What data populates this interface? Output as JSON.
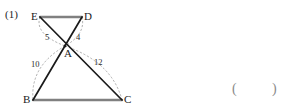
{
  "problem": {
    "number_label": "(1)"
  },
  "figure": {
    "type": "geometry-diagram",
    "vertices": [
      {
        "id": "E",
        "label": "E",
        "x": 40,
        "y": 17
      },
      {
        "id": "D",
        "label": "D",
        "x": 82,
        "y": 17
      },
      {
        "id": "A",
        "label": "A",
        "x": 65,
        "y": 46
      },
      {
        "id": "B",
        "label": "B",
        "x": 33,
        "y": 100
      },
      {
        "id": "C",
        "label": "C",
        "x": 122,
        "y": 100
      }
    ],
    "vertex_label_positions": [
      {
        "id": "E",
        "label": "E",
        "left": 31,
        "top": 11
      },
      {
        "id": "D",
        "label": "D",
        "left": 84,
        "top": 11
      },
      {
        "id": "A",
        "label": "A",
        "left": 64,
        "top": 48
      },
      {
        "id": "B",
        "label": "B",
        "left": 23,
        "top": 94
      },
      {
        "id": "C",
        "label": "C",
        "left": 124,
        "top": 94
      }
    ],
    "solid_segments": [
      {
        "from": "E",
        "to": "D",
        "color": "#808080",
        "width": 2.2
      },
      {
        "from": "B",
        "to": "C",
        "color": "#808080",
        "width": 2.2
      },
      {
        "from": "E",
        "to": "C",
        "color": "#1a1a1a",
        "width": 1.6
      },
      {
        "from": "D",
        "to": "B",
        "color": "#1a1a1a",
        "width": 1.6
      }
    ],
    "dashed_arcs": [
      {
        "from": "E",
        "to": "A",
        "measure": "5"
      },
      {
        "from": "D",
        "to": "A",
        "measure": "4"
      },
      {
        "from": "B",
        "to": "A",
        "measure": "10"
      },
      {
        "from": "C",
        "to": "A",
        "measure": "12"
      }
    ],
    "measure_labels": [
      {
        "text": "5",
        "left": 45,
        "top": 33
      },
      {
        "text": "4",
        "left": 76,
        "top": 33
      },
      {
        "text": "10",
        "left": 31,
        "top": 60
      },
      {
        "text": "12",
        "left": 94,
        "top": 58
      }
    ],
    "colors": {
      "solid_gray": "#808080",
      "solid_dark": "#1a1a1a",
      "dashed_gray": "#9a9a9a",
      "text": "#1b1b1b"
    }
  },
  "answer_field": {
    "open_paren": "(",
    "close_paren": ")"
  },
  "watermark": {
    "text": " "
  }
}
